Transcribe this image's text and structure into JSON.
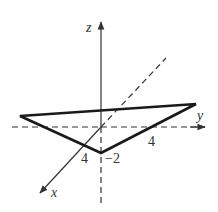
{
  "diagram": {
    "type": "3d-coordinate-triangle",
    "axes": {
      "z_label": "z",
      "y_label": "y",
      "x_label": "x"
    },
    "tick_labels": {
      "x_intercept": "4",
      "y_intercept": "4",
      "z_intercept": "−2"
    },
    "colors": {
      "axis": "#333333",
      "triangle": "#1a1a1a",
      "background": "#ffffff"
    }
  }
}
